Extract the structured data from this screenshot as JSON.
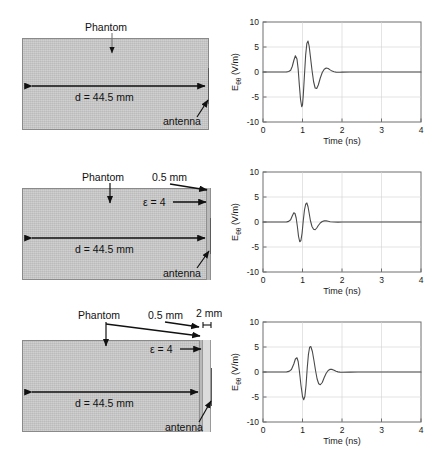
{
  "figure": {
    "panel_count": 3,
    "schematic_labels": {
      "phantom": "Phantom",
      "distance": "d = 44.5 mm",
      "antenna": "antenna",
      "layer_05": "0.5 mm",
      "epsilon": "ε = 4",
      "gap_2mm": "2 mm"
    },
    "plot_axes": {
      "xlabel": "Time (ns)",
      "ylabel_main": "E",
      "ylabel_sub": "θθ",
      "ylabel_units": " (V/m)",
      "xticks": [
        "0",
        "1",
        "2",
        "3",
        "4"
      ],
      "yticks": [
        "-10",
        "-5",
        "0",
        "5",
        "10"
      ],
      "xlim": [
        0,
        4
      ],
      "ylim": [
        -10,
        10
      ]
    },
    "colors": {
      "phantom_fill": "#c9c9c9",
      "layer_fill": "#b9b9b9",
      "gap_fill": "#dcdcdc",
      "trace": "#4a4a4a",
      "axis": "#6e6e6e",
      "grid": "#d2d2d2",
      "background": "#ffffff"
    }
  },
  "panels": [
    {
      "id": "panel-1",
      "name": "no-coating",
      "schematic": {
        "has_layer_05": false,
        "has_gap_2mm": false,
        "labels": [
          "Phantom",
          "d = 44.5 mm",
          "antenna"
        ]
      }
    },
    {
      "id": "panel-2",
      "name": "coating-0p5mm",
      "schematic": {
        "has_layer_05": true,
        "has_gap_2mm": false,
        "labels": [
          "Phantom",
          "0.5 mm",
          "ε = 4",
          "d = 44.5 mm",
          "antenna"
        ]
      }
    },
    {
      "id": "panel-3",
      "name": "coating-0p5mm-gap-2mm",
      "schematic": {
        "has_layer_05": true,
        "has_gap_2mm": true,
        "labels": [
          "Phantom",
          "0.5 mm",
          "2 mm",
          "ε = 4",
          "d = 44.5 mm",
          "antenna"
        ]
      }
    }
  ],
  "chart_data": [
    {
      "type": "line",
      "id": "waveform-1",
      "title": "",
      "xlabel": "Time (ns)",
      "ylabel": "Eθθ (V/m)",
      "xlim": [
        0,
        4
      ],
      "ylim": [
        -10,
        10
      ],
      "xticks": [
        0,
        1,
        2,
        3,
        4
      ],
      "yticks": [
        -10,
        -5,
        0,
        5,
        10
      ],
      "grid": true,
      "legend": "none",
      "series": [
        {
          "name": "E_theta_theta",
          "x": [
            0.0,
            0.1,
            0.2,
            0.3,
            0.4,
            0.5,
            0.6,
            0.65,
            0.7,
            0.74,
            0.78,
            0.82,
            0.86,
            0.89,
            0.92,
            0.95,
            0.98,
            1.0,
            1.02,
            1.05,
            1.08,
            1.11,
            1.14,
            1.17,
            1.2,
            1.24,
            1.28,
            1.32,
            1.36,
            1.4,
            1.45,
            1.5,
            1.55,
            1.6,
            1.65,
            1.7,
            1.75,
            1.8,
            1.85,
            1.9,
            1.95,
            2.0,
            2.2,
            2.4,
            2.6,
            2.8,
            3.0,
            3.2,
            3.4,
            3.6,
            3.8,
            4.0
          ],
          "y": [
            0.0,
            0.0,
            0.0,
            0.0,
            0.0,
            0.0,
            0.02,
            0.1,
            0.35,
            1.1,
            2.3,
            3.25,
            2.6,
            0.6,
            -2.6,
            -5.5,
            -6.95,
            -6.6,
            -4.6,
            -0.6,
            3.4,
            5.7,
            6.2,
            5.1,
            3.1,
            0.4,
            -1.9,
            -3.2,
            -3.3,
            -2.6,
            -1.2,
            -0.1,
            0.55,
            0.8,
            0.7,
            0.42,
            0.18,
            0.05,
            -0.02,
            -0.05,
            -0.04,
            -0.02,
            0.0,
            0.0,
            0.0,
            0.0,
            0.0,
            0.0,
            0.0,
            0.0,
            0.0,
            0.0
          ],
          "peak_positive": 6.2,
          "peak_negative": -6.95
        }
      ]
    },
    {
      "type": "line",
      "id": "waveform-2",
      "title": "",
      "xlabel": "Time (ns)",
      "ylabel": "Eθθ (V/m)",
      "xlim": [
        0,
        4
      ],
      "ylim": [
        -10,
        10
      ],
      "xticks": [
        0,
        1,
        2,
        3,
        4
      ],
      "yticks": [
        -10,
        -5,
        0,
        5,
        10
      ],
      "grid": true,
      "legend": "none",
      "series": [
        {
          "name": "E_theta_theta",
          "x": [
            0.0,
            0.1,
            0.2,
            0.3,
            0.4,
            0.5,
            0.6,
            0.65,
            0.7,
            0.74,
            0.78,
            0.81,
            0.84,
            0.87,
            0.9,
            0.93,
            0.96,
            0.99,
            1.02,
            1.05,
            1.08,
            1.11,
            1.14,
            1.17,
            1.2,
            1.24,
            1.28,
            1.32,
            1.36,
            1.4,
            1.45,
            1.5,
            1.55,
            1.6,
            1.65,
            1.7,
            1.8,
            1.9,
            2.0,
            2.2,
            2.4,
            2.6,
            2.8,
            3.0,
            3.2,
            3.4,
            3.6,
            3.8,
            4.0
          ],
          "y": [
            0.0,
            0.0,
            0.0,
            0.0,
            0.0,
            0.0,
            0.02,
            0.12,
            0.45,
            1.2,
            1.85,
            1.7,
            0.8,
            -0.9,
            -2.9,
            -3.95,
            -3.7,
            -2.2,
            0.3,
            2.4,
            3.55,
            3.8,
            3.05,
            1.7,
            0.3,
            -0.9,
            -1.45,
            -1.55,
            -1.2,
            -0.7,
            -0.2,
            0.1,
            0.22,
            0.22,
            0.14,
            0.06,
            0.0,
            -0.02,
            0.0,
            0.0,
            0.0,
            0.0,
            0.0,
            0.0,
            0.0,
            0.0,
            0.0,
            0.0,
            0.0
          ],
          "peak_positive": 3.8,
          "peak_negative": -3.95
        }
      ]
    },
    {
      "type": "line",
      "id": "waveform-3",
      "title": "",
      "xlabel": "Time (ns)",
      "ylabel": "Eθθ (V/m)",
      "xlim": [
        0,
        4
      ],
      "ylim": [
        -10,
        10
      ],
      "xticks": [
        0,
        1,
        2,
        3,
        4
      ],
      "yticks": [
        -10,
        -5,
        0,
        5,
        10
      ],
      "grid": true,
      "legend": "none",
      "series": [
        {
          "name": "E_theta_theta",
          "x": [
            0.0,
            0.1,
            0.2,
            0.3,
            0.4,
            0.5,
            0.6,
            0.66,
            0.72,
            0.78,
            0.82,
            0.86,
            0.89,
            0.92,
            0.96,
            1.0,
            1.03,
            1.06,
            1.09,
            1.12,
            1.15,
            1.18,
            1.21,
            1.25,
            1.29,
            1.33,
            1.37,
            1.41,
            1.45,
            1.5,
            1.55,
            1.6,
            1.65,
            1.7,
            1.75,
            1.8,
            1.85,
            1.9,
            1.95,
            2.0,
            2.2,
            2.4,
            2.6,
            2.8,
            3.0,
            3.2,
            3.4,
            3.6,
            3.8,
            4.0
          ],
          "y": [
            0.0,
            0.0,
            0.0,
            0.0,
            0.0,
            0.0,
            0.02,
            0.12,
            0.5,
            1.6,
            2.6,
            2.85,
            2.1,
            0.3,
            -2.6,
            -4.9,
            -5.55,
            -4.9,
            -2.6,
            0.8,
            3.5,
            4.95,
            5.1,
            4.1,
            2.3,
            0.3,
            -1.4,
            -2.35,
            -2.55,
            -2.1,
            -1.1,
            -0.25,
            0.3,
            0.55,
            0.52,
            0.34,
            0.15,
            0.03,
            -0.03,
            -0.05,
            -0.03,
            -0.01,
            0.0,
            0.0,
            0.0,
            0.0,
            0.0,
            0.0,
            0.0,
            0.0
          ],
          "peak_positive": 5.1,
          "peak_negative": -5.55
        }
      ]
    }
  ]
}
